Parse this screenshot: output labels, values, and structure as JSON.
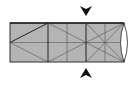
{
  "diagram": {
    "type": "origami-fold-diagram",
    "paper_color": "#b4b4b4",
    "line_color": "#333333",
    "arrows": [
      {
        "name": "arrow-down-top",
        "direction": "down",
        "x": 86
      },
      {
        "name": "arrow-up-bottom",
        "direction": "up",
        "x": 86
      }
    ],
    "rect": {
      "x": 10,
      "y": 23,
      "w": 114,
      "h": 39
    }
  }
}
